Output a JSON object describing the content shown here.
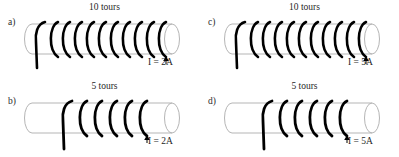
{
  "figure": {
    "background_color": "#ffffff",
    "ink_color": "#000000",
    "cylinder_outline_color": "#b5b5b5",
    "text_color": "#1f1f1f",
    "layout": "2x2 grid of solenoid diagrams"
  },
  "panels": [
    {
      "id": "a",
      "label": "a)",
      "turns_label": "10 tours",
      "turns_count": 10,
      "current_label": "I = 2A",
      "current_value": 2,
      "current_unit": "A",
      "arrow_icon": "up-arrow-icon",
      "coil_span": "full",
      "position": "top-left"
    },
    {
      "id": "c",
      "label": "c)",
      "turns_label": "10 tours",
      "turns_count": 10,
      "current_label": "I = 5A",
      "current_value": 5,
      "current_unit": "A",
      "arrow_icon": "up-arrow-icon",
      "coil_span": "full",
      "position": "top-right"
    },
    {
      "id": "b",
      "label": "b)",
      "turns_label": "5 tours",
      "turns_count": 5,
      "current_label": "I = 2A",
      "current_value": 2,
      "current_unit": "A",
      "arrow_icon": "up-arrow-icon",
      "coil_span": "partial",
      "position": "bottom-left"
    },
    {
      "id": "d",
      "label": "d)",
      "turns_label": "5 tours",
      "turns_count": 5,
      "current_label": "I = 5A",
      "current_value": 5,
      "current_unit": "A",
      "arrow_icon": "up-arrow-icon",
      "coil_span": "partial",
      "position": "bottom-right"
    }
  ]
}
